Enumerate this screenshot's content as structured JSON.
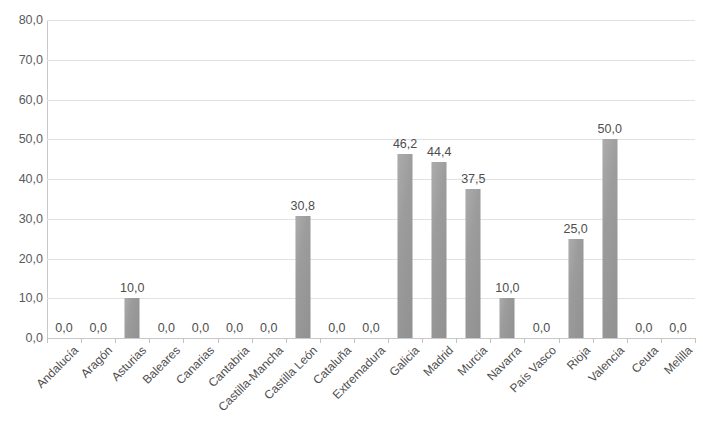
{
  "chart_data": {
    "type": "bar",
    "title": "",
    "subtitle": "",
    "xlabel": "",
    "ylabel": "",
    "ylim": [
      0,
      80
    ],
    "ytick_step": 10,
    "grid": true,
    "legend": false,
    "decimal_separator": ",",
    "bar_color": "#9a9a9a",
    "gridline_color": "#e2e2e2",
    "axis_color": "#c9c9c9",
    "categories": [
      "Andalucía",
      "Aragón",
      "Asturias",
      "Baleares",
      "Canarias",
      "Cantabria",
      "Castilla-Mancha",
      "Castilla León",
      "Cataluña",
      "Extremadura",
      "Galicia",
      "Madrid",
      "Murcia",
      "Navarra",
      "País Vasco",
      "Rioja",
      "Valencia",
      "Ceuta",
      "Melilla"
    ],
    "values": [
      0.0,
      0.0,
      10.0,
      0.0,
      0.0,
      0.0,
      0.0,
      30.8,
      0.0,
      0.0,
      46.2,
      44.4,
      37.5,
      10.0,
      0.0,
      25.0,
      50.0,
      0.0,
      0.0
    ],
    "value_labels": [
      "0,0",
      "0,0",
      "10,0",
      "0,0",
      "0,0",
      "0,0",
      "0,0",
      "30,8",
      "0,0",
      "0,0",
      "46,2",
      "44,4",
      "37,5",
      "10,0",
      "0,0",
      "25,0",
      "50,0",
      "0,0",
      "0,0"
    ],
    "ytick_labels": [
      "80,0",
      "70,0",
      "60,0",
      "50,0",
      "40,0",
      "30,0",
      "20,0",
      "10,0",
      "0,0"
    ],
    "ytick_values": [
      80,
      70,
      60,
      50,
      40,
      30,
      20,
      10,
      0
    ]
  }
}
